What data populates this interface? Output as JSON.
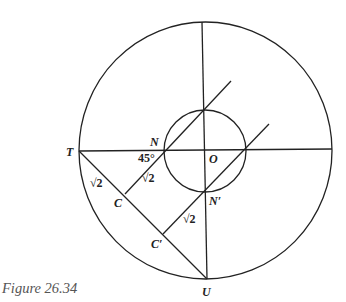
{
  "caption": "Figure 26.34",
  "labels": {
    "T": "T",
    "N": "N",
    "O": "O",
    "N_prime": "N′",
    "C": "C",
    "C_prime": "C′",
    "U": "U",
    "angle": "45°",
    "sqrt2_TC": "√2",
    "sqrt2_CN": "√2",
    "sqrt2_CpNp": "√2"
  },
  "geometry": {
    "large_circle": {
      "cx": 205.5,
      "cy": 150.5,
      "r": 128
    },
    "small_circle": {
      "cx": 205,
      "cy": 150,
      "r": 41
    },
    "points": {
      "T": [
        79,
        151
      ],
      "N": [
        164,
        150
      ],
      "O": [
        205,
        150
      ],
      "N_prime": [
        206,
        191
      ],
      "C": [
        125,
        194
      ],
      "C_prime": [
        163,
        234
      ],
      "U": [
        207,
        279
      ]
    }
  }
}
